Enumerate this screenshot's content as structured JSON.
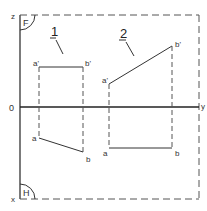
{
  "diagram": {
    "type": "orthographic-projection",
    "planes": {
      "frontal_label": "F",
      "horizontal_label": "H"
    },
    "axes": {
      "z_label": "z",
      "origin_label": "0",
      "y_label": "y",
      "x_label": "x"
    },
    "figures": [
      {
        "number": "1",
        "points": {
          "a_prime": "a'",
          "b_prime": "b'",
          "a": "a",
          "b": "b"
        }
      },
      {
        "number": "2",
        "points": {
          "a_prime": "a'",
          "b_prime": "b'",
          "a": "a",
          "b": "b"
        }
      }
    ],
    "colors": {
      "line": "#333333",
      "dashed": "#555555",
      "background": "#ffffff"
    }
  }
}
